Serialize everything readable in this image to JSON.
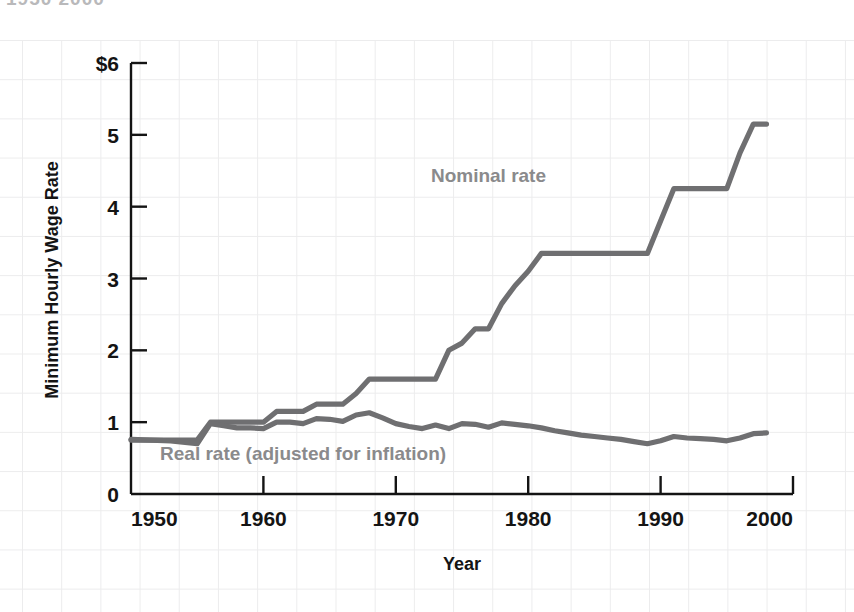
{
  "top_cut_text": "1950  2000",
  "chart_data": {
    "type": "line",
    "title": "",
    "xlabel": "Year",
    "ylabel": "Minimum Hourly Wage Rate",
    "xlim": [
      1950,
      2000
    ],
    "ylim": [
      0,
      6
    ],
    "xticks": [
      1950,
      1960,
      1970,
      1980,
      1990,
      2000
    ],
    "xtick_labels": [
      "1950",
      "1960",
      "1970",
      "1980",
      "1990",
      "2000"
    ],
    "yticks": [
      0,
      1,
      2,
      3,
      4,
      5,
      6
    ],
    "ytick_labels": [
      "0",
      "1",
      "2",
      "3",
      "4",
      "5",
      "$6"
    ],
    "grid": true,
    "legend": "inline-annotations",
    "line_color": "#6f6f71",
    "series": [
      {
        "name": "Nominal rate",
        "label_x": 1977,
        "label_y": 4.35,
        "x": [
          1950,
          1955,
          1956,
          1960,
          1961,
          1962,
          1963,
          1964,
          1965,
          1966,
          1967,
          1968,
          1973,
          1974,
          1975,
          1976,
          1977,
          1978,
          1979,
          1980,
          1981,
          1989,
          1990,
          1991,
          1995,
          1996,
          1997,
          1998
        ],
        "values": [
          0.75,
          0.75,
          1.0,
          1.0,
          1.15,
          1.15,
          1.15,
          1.25,
          1.25,
          1.25,
          1.4,
          1.6,
          1.6,
          2.0,
          2.1,
          2.3,
          2.3,
          2.65,
          2.9,
          3.1,
          3.35,
          3.35,
          3.8,
          4.25,
          4.25,
          4.75,
          5.15,
          5.15
        ]
      },
      {
        "name": "Real rate (adjusted for inflation)",
        "label_x": 1963,
        "label_y": 0.48,
        "x": [
          1950,
          1953,
          1955,
          1956,
          1957,
          1958,
          1959,
          1960,
          1961,
          1962,
          1963,
          1964,
          1965,
          1966,
          1967,
          1968,
          1969,
          1970,
          1971,
          1972,
          1973,
          1974,
          1975,
          1976,
          1977,
          1978,
          1979,
          1980,
          1981,
          1982,
          1983,
          1984,
          1985,
          1986,
          1987,
          1988,
          1989,
          1990,
          1991,
          1992,
          1993,
          1994,
          1995,
          1996,
          1997,
          1998
        ],
        "values": [
          0.76,
          0.74,
          0.7,
          0.98,
          0.95,
          0.92,
          0.92,
          0.91,
          1.0,
          1.0,
          0.98,
          1.05,
          1.04,
          1.01,
          1.1,
          1.13,
          1.06,
          0.98,
          0.94,
          0.91,
          0.96,
          0.91,
          0.98,
          0.97,
          0.93,
          0.99,
          0.97,
          0.95,
          0.92,
          0.88,
          0.85,
          0.82,
          0.8,
          0.78,
          0.76,
          0.73,
          0.7,
          0.74,
          0.8,
          0.78,
          0.77,
          0.76,
          0.74,
          0.78,
          0.84,
          0.85
        ]
      }
    ]
  }
}
